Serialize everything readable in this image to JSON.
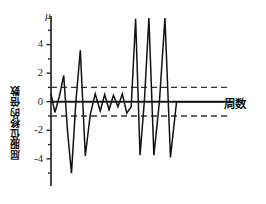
{
  "chart_data": {
    "type": "line",
    "title": "",
    "subtitle": "",
    "xlabel": "周数",
    "ylabel": "屈服位移的倍数",
    "y_axis_symbol": "μ",
    "xlim": [
      0,
      32
    ],
    "ylim": [
      -5.9,
      6.0
    ],
    "yticks": [
      -4,
      -2,
      0,
      2,
      4
    ],
    "ytick_labels": [
      "-4",
      "-2",
      "0",
      "2",
      "4"
    ],
    "yticks_minor": [
      -5,
      -3,
      -1,
      1,
      3,
      5
    ],
    "xticks": [],
    "xtick_labels": [],
    "grid": false,
    "legend": null,
    "annotations": [
      {
        "label": "上限 +1",
        "value": 1,
        "style": "dashed-horizontal-line"
      },
      {
        "label": "下限 -1",
        "value": -1,
        "style": "dashed-horizontal-line"
      },
      {
        "label": "零线 0",
        "value": 0,
        "style": "solid-horizontal-line"
      }
    ],
    "series": [
      {
        "name": "位移历程",
        "x": [
          0,
          0.7,
          1.5,
          2.3,
          3.0,
          3.7,
          4.5,
          5.3,
          6.2,
          7.1,
          8.0,
          8.9,
          9.7,
          10.5,
          11.3,
          12.1,
          12.9,
          13.7,
          14.5,
          15.3,
          16.1,
          16.9,
          17.7,
          18.6,
          19.6,
          20.6,
          21.6,
          22.7,
          23.7,
          24.8,
          25.8,
          26.9,
          27.9,
          29.0,
          30.0,
          31.2
        ],
        "values": [
          0.55,
          -0.75,
          0.35,
          1.85,
          -2.1,
          -5.0,
          0.0,
          3.6,
          -3.8,
          -0.9,
          0.55,
          -0.65,
          0.5,
          -0.55,
          0.45,
          -0.35,
          0.55,
          -0.8,
          -0.35,
          5.8,
          -3.75,
          0.15,
          5.85,
          -3.75,
          0.0,
          5.85,
          -3.9,
          0.0,
          0.0,
          0.0,
          0.0,
          0.0,
          0.0,
          0.0,
          0.0,
          0.0
        ]
      }
    ]
  },
  "figure": {
    "axis_color": "#1a1a1a",
    "line_color": "#111111",
    "limit_color": "#333333",
    "background": "#ffffff"
  }
}
